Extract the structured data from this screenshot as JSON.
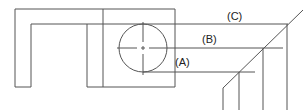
{
  "diagram": {
    "title": "",
    "labels": [
      {
        "id": "A",
        "text": "(A)",
        "x": 175,
        "y": 66
      },
      {
        "id": "B",
        "text": "(B)",
        "x": 202,
        "y": 43
      },
      {
        "id": "C",
        "text": "(C)",
        "x": 227,
        "y": 20
      }
    ],
    "colors": {
      "line": "#555555",
      "text": "#222222",
      "background": "#ffffff"
    }
  }
}
